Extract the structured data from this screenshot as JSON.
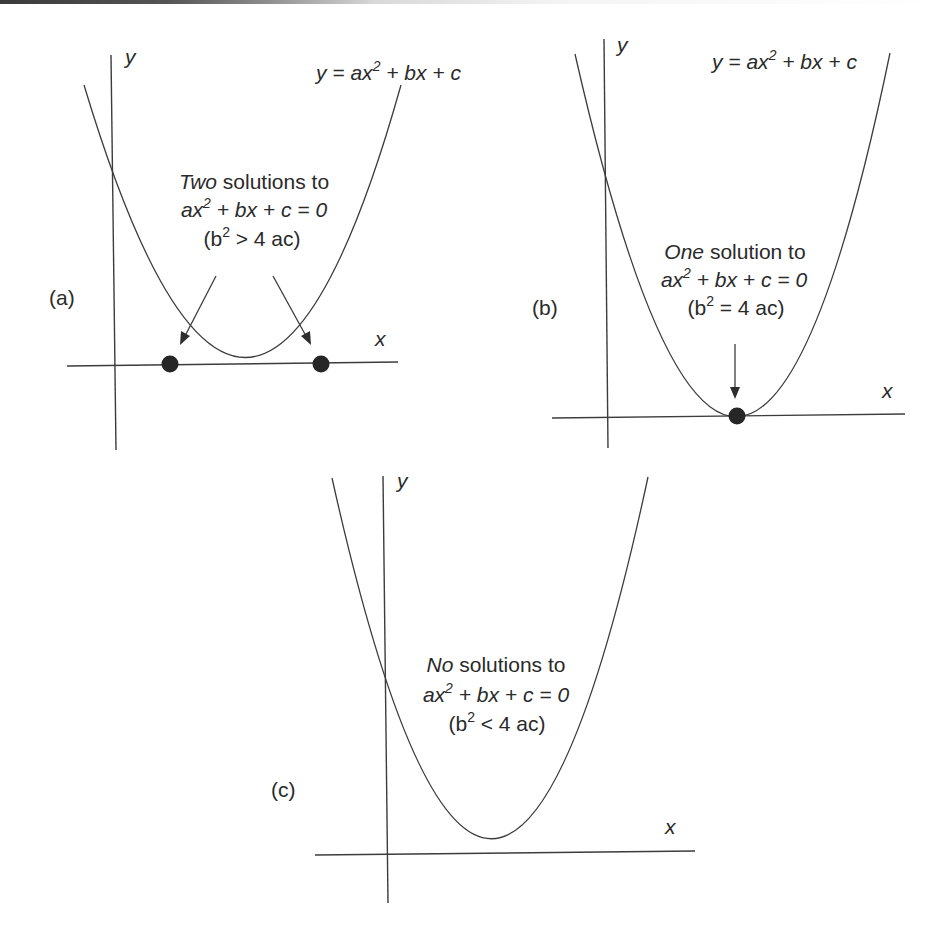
{
  "figure": {
    "panels": [
      {
        "id": "a",
        "label": "(a)",
        "equation": {
          "prefix": "y = ax",
          "exp": "2",
          "suffix": " + bx + c"
        },
        "caption": {
          "emph": "Two",
          "rest": " solutions to",
          "eq_prefix": "ax",
          "eq_exp": "2",
          "eq_suffix": " + bx + c = 0",
          "cond_open": "(b",
          "cond_exp": "2",
          "cond_rest": " > 4 ac)"
        },
        "axis_x": "x",
        "axis_y": "y",
        "roots_marked": 2
      },
      {
        "id": "b",
        "label": "(b)",
        "equation": {
          "prefix": "y = ax",
          "exp": "2",
          "suffix": " + bx + c"
        },
        "caption": {
          "emph": "One",
          "rest": " solution to",
          "eq_prefix": "ax",
          "eq_exp": "2",
          "eq_suffix": " + bx + c = 0",
          "cond_open": "(b",
          "cond_exp": "2",
          "cond_rest": " = 4 ac)"
        },
        "axis_x": "x",
        "axis_y": "y",
        "roots_marked": 1
      },
      {
        "id": "c",
        "label": "(c)",
        "caption": {
          "emph": "No",
          "rest": " solutions to",
          "eq_prefix": "ax",
          "eq_exp": "2",
          "eq_suffix": " + bx + c = 0",
          "cond_open": "(b",
          "cond_exp": "2",
          "cond_rest": " < 4 ac)"
        },
        "axis_x": "x",
        "axis_y": "y",
        "roots_marked": 0
      }
    ],
    "colors": {
      "ink": "#3c3c3c",
      "dot": "#262626",
      "background": "#ffffff"
    }
  }
}
